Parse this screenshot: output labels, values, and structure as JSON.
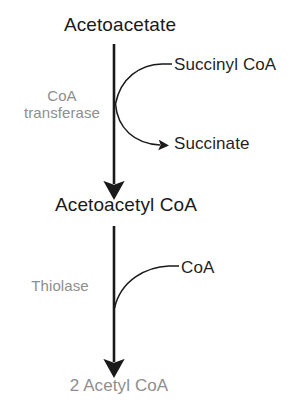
{
  "diagram": {
    "type": "biochemical-pathway",
    "colors": {
      "text_primary": "#1a1a1a",
      "text_muted": "#8e8e8e",
      "arrow": "#1a1a1a",
      "background": "#ffffff"
    },
    "nodes": {
      "substrate_top": "Acetoacetate",
      "intermediate": "Acetoacetyl CoA",
      "product_bottom": "2 Acetyl CoA"
    },
    "enzymes": {
      "step1_line1": "CoA",
      "step1_line2": "transferase",
      "step2": "Thiolase"
    },
    "cosubstrates": {
      "step1_in": "Succinyl CoA",
      "step1_out": "Succinate",
      "step2_in": "CoA"
    }
  }
}
